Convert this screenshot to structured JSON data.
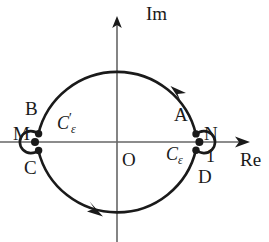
{
  "figure": {
    "kind": "complex-plane-contour-diagram",
    "colors": {
      "ink": "#1a1a1a",
      "axis": "#555555",
      "background": "#ffffff"
    },
    "axes": {
      "imaginary_label": "Im",
      "real_label": "Re",
      "origin_label": "O"
    },
    "points": {
      "a": "A",
      "b": "B",
      "c": "C",
      "d": "D",
      "m": "M",
      "n": "N",
      "one": "1"
    },
    "contours": {
      "c_eps": {
        "base": "C",
        "sub": "ε",
        "prime": ""
      },
      "c_eps_prime": {
        "base": "C",
        "sub": "ε",
        "prime": "′"
      }
    },
    "geometry": {
      "center_x": 117,
      "center_y": 142,
      "radius": 81,
      "indent_radius": 11,
      "orientation": "counterclockwise"
    }
  }
}
